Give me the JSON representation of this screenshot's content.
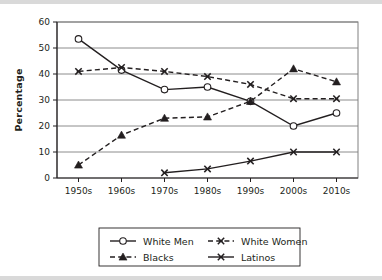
{
  "chart_data": {
    "type": "line",
    "title": "",
    "xlabel": "",
    "ylabel": "Percentage",
    "categories": [
      "1950s",
      "1960s",
      "1970s",
      "1980s",
      "1990s",
      "2000s",
      "2010s"
    ],
    "ylim": [
      0,
      60
    ],
    "yticks": [
      0,
      10,
      20,
      30,
      40,
      50,
      60
    ],
    "grid": "horizontal",
    "legend_position": "bottom-center",
    "series": [
      {
        "name": "White Men",
        "marker": "open-circle",
        "line": "solid",
        "color": "#231f20",
        "values": [
          53.5,
          41.5,
          34,
          35,
          29.5,
          20,
          25
        ]
      },
      {
        "name": "White Women",
        "marker": "cross-x",
        "line": "dashed",
        "color": "#231f20",
        "values": [
          41,
          42.5,
          41,
          39,
          36,
          30.5,
          30.5
        ]
      },
      {
        "name": "Blacks",
        "marker": "filled-triangle",
        "line": "dashed",
        "color": "#231f20",
        "values": [
          5,
          16.5,
          23,
          23.5,
          29.5,
          42,
          37
        ]
      },
      {
        "name": "Latinos",
        "marker": "cross-x",
        "line": "solid",
        "color": "#231f20",
        "values": [
          null,
          null,
          2,
          3.5,
          6.5,
          10,
          10
        ]
      }
    ]
  },
  "legend": {
    "entries": [
      {
        "label": "White Men"
      },
      {
        "label": "White Women"
      },
      {
        "label": "Blacks"
      },
      {
        "label": "Latinos"
      }
    ]
  },
  "colors": {
    "ink": "#231f20",
    "grid": "#808080",
    "frame": "#808080",
    "band": "#d9d9d9"
  }
}
